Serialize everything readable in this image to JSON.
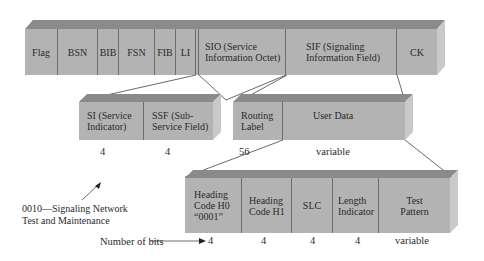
{
  "colors": {
    "face": "#b3b3b3",
    "top": "#8a8a8a",
    "side": "#c9c9c9",
    "divider": "#6e6e6e",
    "text": "#2a2a2a"
  },
  "row1": {
    "fields": [
      {
        "label": "Flag"
      },
      {
        "label": "BSN"
      },
      {
        "label": "BIB"
      },
      {
        "label": "FSN"
      },
      {
        "label": "FIB"
      },
      {
        "label": "LI"
      },
      {
        "label": "SIO (Service Information Octet)"
      },
      {
        "label": "SIF (Signaling Information Field)"
      },
      {
        "label": "CK"
      }
    ]
  },
  "row2a": {
    "fields": [
      {
        "label": "SI (Service Indicator)",
        "bits": "4"
      },
      {
        "label": "SSF (Sub-Service Field)",
        "bits": "4"
      }
    ]
  },
  "row2b": {
    "fields": [
      {
        "label": "Routing Label",
        "bits": "56"
      },
      {
        "label": "User Data",
        "bits": "variable"
      }
    ]
  },
  "annotation": {
    "si_value": "0010—Signaling Network Test and Maintenance",
    "line1": "0010—Signaling Network",
    "line2": "Test and Maintenance"
  },
  "row3": {
    "bits_label": "Number of bits",
    "fields": [
      {
        "label": "Heading Code H0 “0001”",
        "bits": "4"
      },
      {
        "label": "Heading Code H1",
        "bits": "4"
      },
      {
        "label": "SLC",
        "bits": "4"
      },
      {
        "label": "Length Indicator",
        "bits": "4"
      },
      {
        "label": "Test Pattern",
        "bits": "variable"
      }
    ]
  }
}
